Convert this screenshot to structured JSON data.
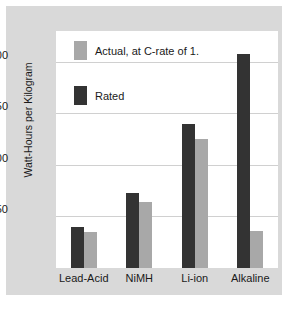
{
  "chart_data": {
    "type": "bar",
    "title": "",
    "xlabel": "",
    "ylabel": "Watt-Hours per Kilogram",
    "categories": [
      "Lead-Acid",
      "NiMH",
      "Li-ion",
      "Alkaline"
    ],
    "series": [
      {
        "name": "Rated",
        "color": "#333333",
        "values": [
          40,
          73,
          140,
          208
        ]
      },
      {
        "name": "Actual, at C-rate of 1.",
        "color": "#a8a8a8",
        "values": [
          35,
          64,
          125,
          36
        ]
      }
    ],
    "ylim": [
      0,
      230
    ],
    "yticks": [
      50,
      100,
      150,
      200
    ],
    "ytick_labels": [
      "50",
      "100",
      "150",
      "200"
    ],
    "grid": "horizontal",
    "legend_position": "upper-left-inside",
    "legend": [
      {
        "label": "Actual, at C-rate of 1.",
        "color": "#a8a8a8"
      },
      {
        "label": "Rated",
        "color": "#333333"
      }
    ]
  },
  "figure": {
    "panel_color": "#d9d9d9",
    "plot_background": "#ffffff",
    "gridline_color": "#d0d0d0"
  }
}
